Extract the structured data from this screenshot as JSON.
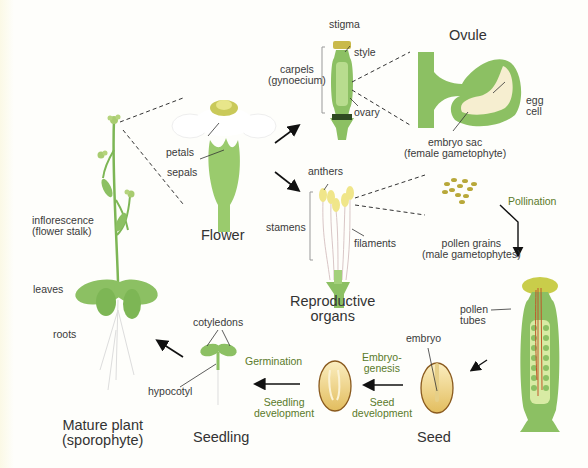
{
  "diagram": {
    "stages": {
      "mature_plant": "Mature plant\n(sporophyte)",
      "flower": "Flower",
      "reproductive_organs": "Reproductive\norgans",
      "ovule": "Ovule",
      "seed": "Seed",
      "seedling": "Seedling"
    },
    "labels": {
      "inflorescence": "inflorescence\n(flower stalk)",
      "leaves": "leaves",
      "roots": "roots",
      "petals": "petals",
      "sepals": "sepals",
      "stigma": "stigma",
      "style": "style",
      "carpels": "carpels\n(gynoecium)",
      "ovary": "ovary",
      "egg_cell": "egg\ncell",
      "embryo_sac": "embryo sac\n(female gametophyte)",
      "anthers": "anthers",
      "stamens": "stamens",
      "filaments": "filaments",
      "pollen_grains": "pollen grains\n(male gametophytes)",
      "pollen_tubes": "pollen\ntubes",
      "embryo": "embryo",
      "cotyledons": "cotyledons",
      "hypocotyl": "hypocotyl"
    },
    "processes": {
      "pollination": "Pollination",
      "embryogenesis": "Embryo-\ngenesis",
      "seed_development": "Seed\ndevelopment",
      "germination": "Germination",
      "seedling_development": "Seedling\ndevelopment"
    },
    "colors": {
      "plant_green": "#8cc063",
      "dark_green": "#5e9a3a",
      "seed_tan": "#e8c877",
      "seed_outline": "#8a5a1e",
      "process_text": "#5a7a2a",
      "pollen_tube": "#c0582a"
    }
  }
}
